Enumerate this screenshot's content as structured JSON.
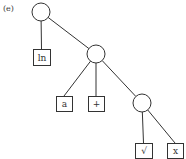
{
  "panel_label": "(e)",
  "colors": {
    "stroke": "#333333",
    "background": "#ffffff"
  },
  "nodes": [
    {
      "id": "n1",
      "type": "operator",
      "cx": 41,
      "cy": 12,
      "r": 9
    },
    {
      "id": "n2",
      "type": "operator",
      "cx": 96,
      "cy": 54,
      "r": 9
    },
    {
      "id": "n3",
      "type": "operator",
      "cx": 142,
      "cy": 103,
      "r": 9
    },
    {
      "id": "l1",
      "type": "leaf",
      "label": "ln",
      "x": 33,
      "y": 49,
      "w": 17,
      "h": 16
    },
    {
      "id": "l2",
      "type": "leaf",
      "label": "a",
      "x": 56,
      "y": 96,
      "w": 16,
      "h": 15
    },
    {
      "id": "l3",
      "type": "leaf",
      "label": "+",
      "x": 88,
      "y": 96,
      "w": 16,
      "h": 15
    },
    {
      "id": "l4",
      "type": "leaf",
      "label": "√",
      "x": 135,
      "y": 143,
      "w": 17,
      "h": 15
    },
    {
      "id": "l5",
      "type": "leaf",
      "label": "x",
      "x": 167,
      "y": 143,
      "w": 16,
      "h": 15
    }
  ],
  "edges": [
    {
      "from": "n1",
      "to": "l1"
    },
    {
      "from": "n1",
      "to": "n2"
    },
    {
      "from": "n2",
      "to": "l2"
    },
    {
      "from": "n2",
      "to": "l3"
    },
    {
      "from": "n2",
      "to": "n3"
    },
    {
      "from": "n3",
      "to": "l4"
    },
    {
      "from": "n3",
      "to": "l5"
    }
  ]
}
